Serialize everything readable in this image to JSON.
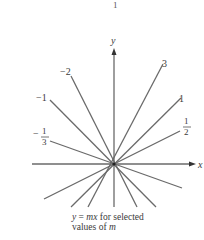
{
  "figure": {
    "page_mark": "1",
    "axes": {
      "x_label": "x",
      "y_label": "y"
    },
    "caption_line1_italic_a": "y",
    "caption_line1_eq": " = ",
    "caption_line1_italic_b": "mx",
    "caption_line1_rest": " for selected",
    "caption_line2_text": "values of ",
    "caption_line2_italic": "m",
    "slopes": [
      {
        "m": "3",
        "label": "3"
      },
      {
        "m": "1",
        "label": "1"
      },
      {
        "m": "1/2",
        "label_num": "1",
        "label_den": "2"
      },
      {
        "m": "-1/3",
        "label_sign": "−",
        "label_num": "1",
        "label_den": "3"
      },
      {
        "m": "-1",
        "label": "−1"
      },
      {
        "m": "-2",
        "label": "−2"
      }
    ]
  }
}
